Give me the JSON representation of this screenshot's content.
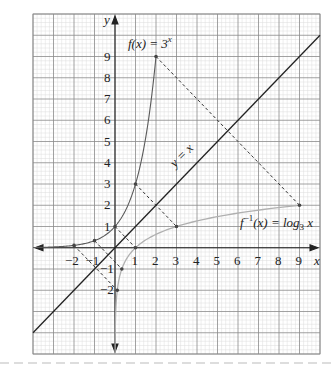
{
  "chart_data": {
    "type": "line",
    "title": "",
    "xlabel": "x",
    "ylabel": "y",
    "xlim": [
      -4,
      10
    ],
    "ylim": [
      -5,
      11
    ],
    "grid": true,
    "grid_minor_step": 0.2,
    "grid_major_step": 1,
    "x_ticks": [
      -2,
      -1,
      1,
      2,
      3,
      4,
      5,
      6,
      7,
      8,
      9
    ],
    "y_ticks": [
      -2,
      -1,
      1,
      2,
      3,
      4,
      5,
      6,
      7,
      8,
      9
    ],
    "series": [
      {
        "name": "f(x) = 3^x",
        "color": "#555555",
        "style": "solid",
        "points": [
          [
            -2,
            0.111
          ],
          [
            -1,
            0.333
          ],
          [
            0,
            1
          ],
          [
            1,
            3
          ],
          [
            2,
            9
          ]
        ]
      },
      {
        "name": "f^-1(x) = log_3 x",
        "color": "#aaaaaa",
        "style": "solid",
        "points": [
          [
            0.111,
            -2
          ],
          [
            0.333,
            -1
          ],
          [
            1,
            0
          ],
          [
            3,
            1
          ],
          [
            9,
            2
          ]
        ]
      },
      {
        "name": "y = x",
        "color": "#222222",
        "style": "solid",
        "points": [
          [
            -4,
            -4
          ],
          [
            10,
            10
          ]
        ]
      }
    ],
    "reflection_segments": [
      {
        "from": [
          2,
          9
        ],
        "to": [
          9,
          2
        ]
      },
      {
        "from": [
          1,
          3
        ],
        "to": [
          3,
          1
        ]
      },
      {
        "from": [
          0,
          1
        ],
        "to": [
          1,
          0
        ]
      },
      {
        "from": [
          -1,
          0.333
        ],
        "to": [
          0.333,
          -1
        ]
      },
      {
        "from": [
          -2,
          0.111
        ],
        "to": [
          0.111,
          -2
        ]
      }
    ],
    "annotations": [
      {
        "text": "f(x) = 3",
        "sup": "x",
        "near": [
          2,
          9
        ]
      },
      {
        "text": "y = x",
        "near": [
          2.8,
          4.2
        ]
      },
      {
        "text": "f",
        "sup": "−1",
        "text2": "(x) = log",
        "sub": "3",
        "text3": " x",
        "near": [
          6,
          1.2
        ]
      }
    ]
  },
  "labels": {
    "x_axis": "x",
    "y_axis": "y",
    "f_label_main": "f(x) = 3",
    "f_label_sup": "x",
    "yx_label": "y = x",
    "inv_f": "f",
    "inv_sup": "−1",
    "inv_mid": "(x) = log",
    "inv_sub": "3",
    "inv_end": " x"
  }
}
